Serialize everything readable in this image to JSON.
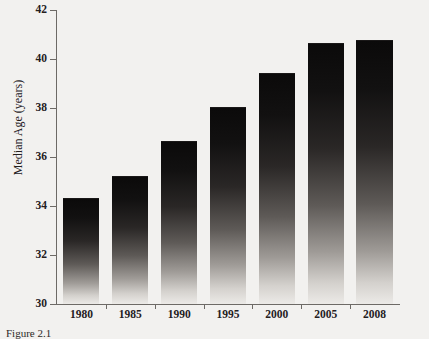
{
  "figure": {
    "caption": "Figure 2.1"
  },
  "chart_data": {
    "type": "bar",
    "title": "",
    "xlabel": "",
    "ylabel": "Median Age (years)",
    "categories": [
      "1980",
      "1985",
      "1990",
      "1995",
      "2000",
      "2005",
      "2008"
    ],
    "values": [
      34.3,
      35.2,
      36.6,
      38.0,
      39.4,
      40.6,
      40.75
    ],
    "ylim": [
      30,
      42
    ],
    "yticks": [
      30,
      32,
      34,
      36,
      38,
      40,
      42
    ],
    "ytick_labels": [
      "30",
      "32",
      "34",
      "36",
      "38",
      "40",
      "42"
    ],
    "grid": false,
    "legend": null,
    "bar_style": "vertical gradient dark-to-light",
    "background_color": "#f2f1ef",
    "axis_color": "#6d6a66",
    "text_color": "#24201e"
  }
}
